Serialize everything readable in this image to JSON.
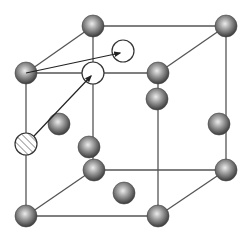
{
  "diagram": {
    "title": "Cubic crystal lattice with interstitial/vacancy diffusion",
    "colors": {
      "edge": "#555555",
      "atom_dark": "#3a3a3a",
      "atom_light": "#e8e8e8",
      "open_site": "#ffffff",
      "arrow": "#222222"
    },
    "atom_radius": 11,
    "edges": [
      {
        "name": "front-top",
        "x1": 26,
        "y1": 73,
        "x2": 158,
        "y2": 73
      },
      {
        "name": "front-left",
        "x1": 26,
        "y1": 73,
        "x2": 26,
        "y2": 216
      },
      {
        "name": "front-right",
        "x1": 158,
        "y1": 73,
        "x2": 158,
        "y2": 216
      },
      {
        "name": "front-bottom",
        "x1": 26,
        "y1": 216,
        "x2": 158,
        "y2": 216
      },
      {
        "name": "back-top",
        "x1": 93,
        "y1": 26,
        "x2": 226,
        "y2": 26
      },
      {
        "name": "back-left",
        "x1": 93,
        "y1": 26,
        "x2": 93,
        "y2": 170
      },
      {
        "name": "back-right",
        "x1": 226,
        "y1": 26,
        "x2": 226,
        "y2": 170
      },
      {
        "name": "back-bottom",
        "x1": 93,
        "y1": 170,
        "x2": 226,
        "y2": 170
      },
      {
        "name": "top-left-diag",
        "x1": 26,
        "y1": 73,
        "x2": 93,
        "y2": 26
      },
      {
        "name": "top-right-diag",
        "x1": 158,
        "y1": 73,
        "x2": 226,
        "y2": 26
      },
      {
        "name": "bottom-left-diag",
        "x1": 26,
        "y1": 216,
        "x2": 93,
        "y2": 170
      },
      {
        "name": "bottom-right-diag",
        "x1": 158,
        "y1": 216,
        "x2": 226,
        "y2": 170
      }
    ],
    "atoms": [
      {
        "name": "corner-back-top-left",
        "cx": 93,
        "cy": 26
      },
      {
        "name": "corner-back-top-right",
        "cx": 226,
        "cy": 26
      },
      {
        "name": "corner-front-top-left",
        "cx": 26,
        "cy": 73
      },
      {
        "name": "corner-front-top-right",
        "cx": 158,
        "cy": 73
      },
      {
        "name": "front-face-right-atom",
        "cx": 157,
        "cy": 99
      },
      {
        "name": "left-face-center",
        "cx": 59,
        "cy": 124
      },
      {
        "name": "right-face-center",
        "cx": 219,
        "cy": 124
      },
      {
        "name": "back-face-atom",
        "cx": 89,
        "cy": 147
      },
      {
        "name": "corner-back-bottom-left",
        "cx": 94,
        "cy": 170
      },
      {
        "name": "bottom-face-center",
        "cx": 124,
        "cy": 193
      },
      {
        "name": "corner-back-bottom-right",
        "cx": 226,
        "cy": 170
      },
      {
        "name": "corner-front-bottom-left",
        "cx": 26,
        "cy": 216
      },
      {
        "name": "corner-front-bottom-right",
        "cx": 158,
        "cy": 216
      }
    ],
    "open_sites": [
      {
        "name": "open-site-top",
        "cx": 123,
        "cy": 51
      },
      {
        "name": "open-site-front",
        "cx": 93,
        "cy": 73
      }
    ],
    "hatched_atoms": [
      {
        "name": "hatched-solute-atom",
        "cx": 26,
        "cy": 144
      }
    ],
    "arrows": [
      {
        "name": "jump-arrow-to-top-site",
        "x1": 26,
        "y1": 73,
        "x2": 120,
        "y2": 53
      },
      {
        "name": "jump-arrow-to-front-site",
        "x1": 34,
        "y1": 136,
        "x2": 91,
        "y2": 76
      }
    ]
  }
}
